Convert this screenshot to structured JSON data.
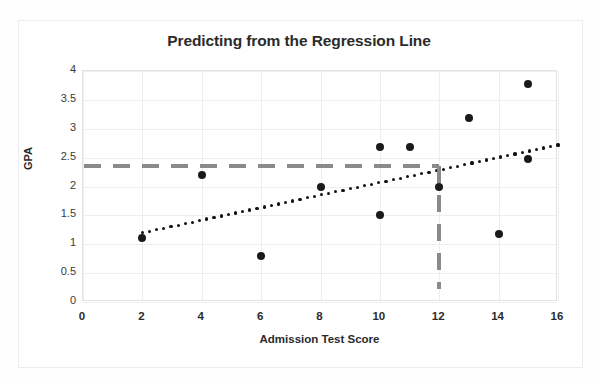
{
  "chart_data": {
    "type": "scatter",
    "title": "Predicting from the Regression Line",
    "xlabel": "Admission Test Score",
    "ylabel": "GPA",
    "xlim": [
      0,
      16
    ],
    "ylim": [
      0,
      4
    ],
    "xticks": [
      "0",
      "2",
      "4",
      "6",
      "8",
      "10",
      "12",
      "14",
      "16"
    ],
    "xtick_values": [
      0,
      2,
      4,
      6,
      8,
      10,
      12,
      14,
      16
    ],
    "yticks": [
      "0",
      "0.5",
      "1",
      "1.5",
      "2",
      "2.5",
      "3",
      "3.5",
      "4"
    ],
    "ytick_values": [
      0,
      0.5,
      1,
      1.5,
      2,
      2.5,
      3,
      3.5,
      4
    ],
    "grid": true,
    "legend": null,
    "series": [
      {
        "name": "Students",
        "type": "scatter",
        "marker": "filled-circle",
        "color": "#1a1a1a",
        "points": [
          {
            "x": 2,
            "y": 1.1
          },
          {
            "x": 4,
            "y": 2.2
          },
          {
            "x": 6,
            "y": 0.8
          },
          {
            "x": 8,
            "y": 2.0
          },
          {
            "x": 10,
            "y": 2.68
          },
          {
            "x": 10,
            "y": 1.5
          },
          {
            "x": 11,
            "y": 2.68
          },
          {
            "x": 12,
            "y": 2.0
          },
          {
            "x": 13,
            "y": 3.18
          },
          {
            "x": 14,
            "y": 1.18
          },
          {
            "x": 15,
            "y": 3.78
          },
          {
            "x": 15,
            "y": 2.48
          }
        ]
      },
      {
        "name": "Regression line",
        "type": "line",
        "style": "dotted",
        "color": "#111111",
        "x_start": 2,
        "x_end": 16,
        "y_start": 1.2,
        "y_end": 2.72,
        "slope": 0.1086,
        "intercept": 0.9829
      }
    ],
    "annotations": [
      {
        "name": "predicted-gpa-guide",
        "type": "hline",
        "style": "dashed",
        "color": "#8a8a8a",
        "y": 2.35,
        "x_from": 0,
        "x_to": 12
      },
      {
        "name": "test-score-guide",
        "type": "vline",
        "style": "dashed",
        "color": "#8a8a8a",
        "x": 12,
        "y_from": 0.22,
        "y_to": 2.35
      }
    ]
  }
}
